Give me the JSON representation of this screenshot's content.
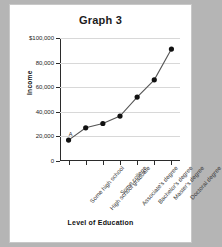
{
  "chart_data": {
    "type": "line",
    "title": "Graph 3",
    "xlabel": "Level of Education",
    "ylabel": "Income",
    "categories": [
      "Some high school",
      "High school graduate",
      "Some college",
      "Associate's degree",
      "Bachelor's degree",
      "Master's degree",
      "Doctoral degree"
    ],
    "values": [
      17000,
      27000,
      30500,
      36500,
      52000,
      66000,
      91000
    ],
    "ylim": [
      0,
      100000
    ],
    "ytick_values": [
      100000,
      80000,
      60000,
      40000,
      20000,
      0
    ],
    "ytick_labels": [
      "$100,000",
      "80,000",
      "60,000",
      "40,000",
      "20,000",
      "0"
    ],
    "grid": true,
    "legend": false,
    "annotations": [
      {
        "text": "A",
        "point_index": 0
      }
    ],
    "marker": "filled-circle",
    "line_color": "#555555",
    "marker_color": "#111111"
  },
  "figure": {
    "background": "#ffffff",
    "page_background": "#b5b5b5"
  }
}
